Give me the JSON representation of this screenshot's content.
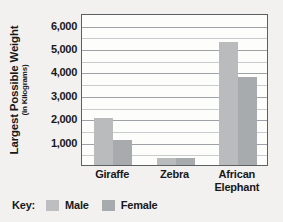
{
  "chart_data": {
    "type": "bar",
    "title": "",
    "xlabel": "",
    "ylabel": "Largest Possible Weight",
    "ylabel_sub": "(in Kilograms)",
    "categories": [
      "Giraffe",
      "Zebra",
      "African Elephant"
    ],
    "series": [
      {
        "name": "Male",
        "color": "#b9bbbd",
        "values": [
          2000,
          320,
          5250
        ]
      },
      {
        "name": "Female",
        "color": "#a8abad",
        "values": [
          1050,
          300,
          3750
        ]
      }
    ],
    "ylim": [
      0,
      6500
    ],
    "ytick_values": [
      1000,
      2000,
      3000,
      4000,
      5000,
      6000
    ],
    "ytick_labels": [
      "1,000",
      "2,000",
      "3,000",
      "4,000",
      "5,000",
      "6,000"
    ],
    "minor_tick_step": 500,
    "grid": true,
    "legend": {
      "title": "Key:",
      "position": "bottom-left",
      "entries": [
        "Male",
        "Female"
      ]
    }
  },
  "xtick_lines": [
    [
      "Giraffe"
    ],
    [
      "Zebra"
    ],
    [
      "African",
      "Elephant"
    ]
  ]
}
